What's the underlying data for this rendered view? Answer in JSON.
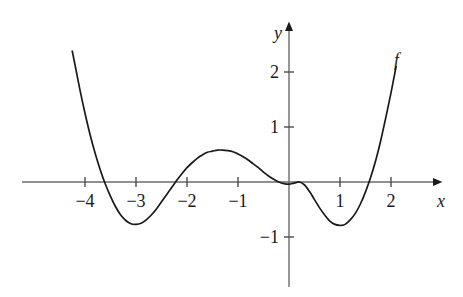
{
  "figure": {
    "kind": "math-function-graph",
    "background_color": "#ffffff",
    "ink_color": "#1a1a1a"
  },
  "chart_data": {
    "type": "line",
    "title": "",
    "subtitle": "",
    "xlabel": "x",
    "ylabel": "y",
    "xlim": [
      -4.7,
      3.0
    ],
    "ylim": [
      -1.6,
      2.35
    ],
    "grid": false,
    "legend_position": "none",
    "annotations": [
      {
        "name": "curve-name",
        "text": "f",
        "x": 2.15,
        "y": 2.25
      }
    ],
    "axes": {
      "x_axis_label": "x",
      "y_axis_label": "y",
      "x_axis_label_style": "italic",
      "y_axis_label_style": "italic",
      "x_ticks": [
        -4,
        -3,
        -2,
        -1,
        1,
        2
      ],
      "x_tick_labels": [
        "−4",
        "−3",
        "−2",
        "−1",
        "1",
        "2"
      ],
      "y_ticks": [
        -1,
        1,
        2
      ],
      "y_tick_labels": [
        "−1",
        "1",
        "2"
      ],
      "origin_label": "",
      "x_arrow": true,
      "y_arrow": true
    },
    "series": [
      {
        "name": "f",
        "color": "#1a1a1a",
        "points": [
          [
            -4.25,
            2.38
          ],
          [
            -4.2,
            2.15
          ],
          [
            -4.1,
            1.68
          ],
          [
            -4.0,
            1.25
          ],
          [
            -3.9,
            0.86
          ],
          [
            -3.8,
            0.52
          ],
          [
            -3.7,
            0.22
          ],
          [
            -3.6,
            -0.04
          ],
          [
            -3.5,
            -0.26
          ],
          [
            -3.4,
            -0.45
          ],
          [
            -3.3,
            -0.6
          ],
          [
            -3.2,
            -0.7
          ],
          [
            -3.1,
            -0.76
          ],
          [
            -3.0,
            -0.77
          ],
          [
            -2.9,
            -0.75
          ],
          [
            -2.8,
            -0.69
          ],
          [
            -2.7,
            -0.6
          ],
          [
            -2.6,
            -0.49
          ],
          [
            -2.5,
            -0.36
          ],
          [
            -2.4,
            -0.23
          ],
          [
            -2.3,
            -0.1
          ],
          [
            -2.2,
            0.03
          ],
          [
            -2.1,
            0.15
          ],
          [
            -2.0,
            0.26
          ],
          [
            -1.9,
            0.35
          ],
          [
            -1.8,
            0.43
          ],
          [
            -1.7,
            0.49
          ],
          [
            -1.6,
            0.54
          ],
          [
            -1.5,
            0.56
          ],
          [
            -1.4,
            0.58
          ],
          [
            -1.3,
            0.58
          ],
          [
            -1.2,
            0.57
          ],
          [
            -1.1,
            0.55
          ],
          [
            -1.0,
            0.51
          ],
          [
            -0.9,
            0.46
          ],
          [
            -0.8,
            0.4
          ],
          [
            -0.7,
            0.33
          ],
          [
            -0.6,
            0.26
          ],
          [
            -0.5,
            0.18
          ],
          [
            -0.4,
            0.11
          ],
          [
            -0.3,
            0.05
          ],
          [
            -0.2,
            0.0
          ],
          [
            -0.1,
            -0.03
          ],
          [
            0.0,
            -0.04
          ],
          [
            0.1,
            -0.02
          ],
          [
            0.2,
            0.0
          ],
          [
            0.3,
            -0.05
          ],
          [
            0.4,
            -0.17
          ],
          [
            0.5,
            -0.32
          ],
          [
            0.6,
            -0.47
          ],
          [
            0.7,
            -0.6
          ],
          [
            0.8,
            -0.71
          ],
          [
            0.9,
            -0.77
          ],
          [
            1.0,
            -0.79
          ],
          [
            1.05,
            -0.785
          ],
          [
            1.1,
            -0.77
          ],
          [
            1.2,
            -0.69
          ],
          [
            1.3,
            -0.57
          ],
          [
            1.4,
            -0.4
          ],
          [
            1.5,
            -0.18
          ],
          [
            1.6,
            0.08
          ],
          [
            1.7,
            0.39
          ],
          [
            1.8,
            0.76
          ],
          [
            1.9,
            1.18
          ],
          [
            2.0,
            1.62
          ],
          [
            2.05,
            1.86
          ],
          [
            2.1,
            2.1
          ]
        ],
        "key_features": {
          "local_minima": [
            {
              "x": -3.05,
              "y": -0.77
            },
            {
              "x": 1.02,
              "y": -0.79
            }
          ],
          "local_maxima": [
            {
              "x": -1.25,
              "y": 0.58
            }
          ],
          "x_intercepts": [
            -3.68,
            -2.25,
            -0.18,
            0.2,
            1.58
          ],
          "inflection_hint": "flat near origin"
        }
      }
    ]
  }
}
